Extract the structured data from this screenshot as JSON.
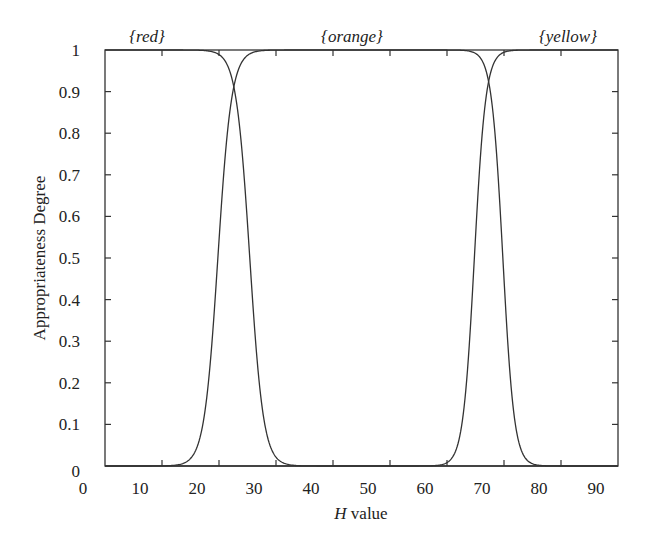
{
  "chart_data": {
    "type": "line",
    "title": "",
    "xlabel": "H value",
    "xlabel_italic_part": "H",
    "xlabel_rest": " value",
    "ylabel": "Appropriateness Degree",
    "xlim": [
      0,
      90
    ],
    "ylim": [
      0,
      1
    ],
    "grid": false,
    "legend": "none (category labels placed above plot)",
    "x_ticks": [
      0,
      10,
      20,
      30,
      40,
      50,
      60,
      70,
      80,
      90
    ],
    "x_tick_labels": [
      "0",
      "10",
      "20",
      "30",
      "40",
      "50",
      "60",
      "70",
      "80",
      "90"
    ],
    "y_ticks": [
      0,
      0.1,
      0.2,
      0.3,
      0.4,
      0.5,
      0.6,
      0.7,
      0.8,
      0.9,
      1
    ],
    "y_tick_labels": [
      "0",
      "0.1",
      "0.2",
      "0.3",
      "0.4",
      "0.5",
      "0.6",
      "0.7",
      "0.8",
      "0.9",
      "1"
    ],
    "top_labels": [
      {
        "text": "{red}",
        "x_px": 147
      },
      {
        "text": "{orange}",
        "x_px": 352
      },
      {
        "text": "{yellow}",
        "x_px": 568
      }
    ],
    "series": [
      {
        "name": "{red}",
        "shape": "falling sigmoid (1 on left, drops to 0)",
        "midpoint_H": 25.4,
        "steepness": 1.2,
        "x": [
          0,
          15,
          18,
          20,
          21,
          22,
          22.6,
          23,
          24,
          25,
          25.4,
          26,
          27,
          28,
          29,
          30,
          32,
          35,
          90
        ],
        "values": [
          1,
          1,
          0.99,
          0.99,
          0.97,
          0.94,
          0.91,
          0.88,
          0.76,
          0.58,
          0.5,
          0.38,
          0.21,
          0.1,
          0.05,
          0.02,
          0.0,
          0.0,
          0
        ]
      },
      {
        "name": "{orange}",
        "shape": "trapezoid with sigmoid edges",
        "rise_midpoint_H": 19.8,
        "fall_midpoint_H": 69.8,
        "x": [
          0,
          10,
          14,
          16,
          17,
          18,
          19,
          19.8,
          21,
          22,
          22.6,
          24,
          26,
          30,
          60,
          65,
          67,
          67.5,
          68,
          69,
          69.8,
          71,
          72,
          74,
          90
        ],
        "values": [
          0,
          0.0,
          0.01,
          0.04,
          0.09,
          0.18,
          0.34,
          0.5,
          0.73,
          0.86,
          0.91,
          0.97,
          0.99,
          1,
          1,
          0.99,
          0.94,
          0.91,
          0.86,
          0.69,
          0.5,
          0.23,
          0.1,
          0.01,
          0
        ]
      },
      {
        "name": "{yellow}",
        "shape": "rising sigmoid (0 on left, rises to 1)",
        "midpoint_H": 64.8,
        "steepness": 1.0,
        "x": [
          0,
          55,
          58,
          60,
          62,
          63,
          64,
          64.8,
          66,
          67,
          67.5,
          68,
          70,
          72,
          90
        ],
        "values": [
          0,
          0.0,
          0.0,
          0.01,
          0.06,
          0.14,
          0.31,
          0.5,
          0.77,
          0.9,
          0.93,
          0.96,
          0.99,
          1,
          1
        ]
      }
    ],
    "crossings": [
      {
        "between": [
          "{red}",
          "{orange}"
        ],
        "H": 22.6,
        "degree": 0.91
      },
      {
        "between": [
          "{orange}",
          "{yellow}"
        ],
        "H": 67.5,
        "degree": 0.93
      }
    ]
  },
  "layout": {
    "plot_left": 105,
    "plot_right": 618,
    "plot_top": 50,
    "plot_bottom": 466,
    "x_label_offset_px": -22,
    "line_color": "#333333",
    "axis_color": "#333333"
  }
}
